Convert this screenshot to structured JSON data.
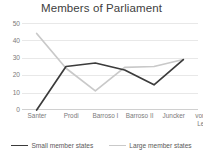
{
  "chart_data": {
    "type": "line",
    "title": "Members of Parliament",
    "xlabel": "",
    "ylabel": "",
    "ylim": [
      0,
      50
    ],
    "yticks": [
      "0",
      "10",
      "20",
      "30",
      "40",
      "50"
    ],
    "grid": true,
    "legend_position": "bottom",
    "categories": [
      "Santer",
      "Prodi",
      "Barroso I",
      "Barroso II",
      "Juncker",
      "von der Leyen"
    ],
    "series": [
      {
        "name": "Small member states",
        "color": "#3b3b3b",
        "values": [
          0,
          25,
          27,
          23,
          14.5,
          29
        ]
      },
      {
        "name": "Large member states",
        "color": "#c9c9c9",
        "values": [
          44,
          24,
          11,
          24.5,
          25,
          29
        ]
      }
    ]
  },
  "axis": {
    "tick_color": "#7a7a7a",
    "grid_color": "#e8e8e8"
  }
}
